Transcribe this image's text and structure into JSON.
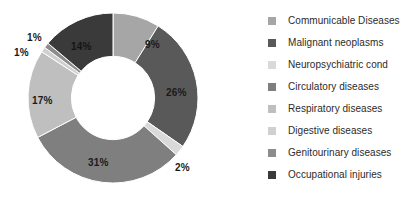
{
  "chart_data": {
    "type": "pie",
    "variant": "doughnut",
    "title": "",
    "xlabel": "",
    "ylabel": "",
    "units": "percent",
    "start_angle_deg": 0,
    "direction": "clockwise",
    "inner_radius_ratio": 0.49,
    "grid": false,
    "legend_position": "right",
    "categories": [
      "Communicable Diseases",
      "Malignant neoplasms",
      "Neuropsychiatric cond",
      "Circulatory diseases",
      "Respiratory diseases",
      "Digestive diseases",
      "Genitourinary diseases",
      "Occupational injuries"
    ],
    "values": [
      9,
      26,
      2,
      31,
      17,
      1,
      1,
      14
    ],
    "data_labels": [
      "9%",
      "26%",
      "2%",
      "31%",
      "17%",
      "1%",
      "1%",
      "14%"
    ],
    "colors": [
      "#a6a6a6",
      "#595959",
      "#d9d9d9",
      "#7f7f7f",
      "#bfbfbf",
      "#d0d0d0",
      "#8c8c8c",
      "#3a3a3a"
    ]
  },
  "legend": {
    "items": [
      {
        "label": "Communicable Diseases",
        "color": "#a6a6a6"
      },
      {
        "label": "Malignant neoplasms",
        "color": "#595959"
      },
      {
        "label": "Neuropsychiatric cond",
        "color": "#d9d9d9"
      },
      {
        "label": "Circulatory diseases",
        "color": "#7f7f7f"
      },
      {
        "label": "Respiratory diseases",
        "color": "#bfbfbf"
      },
      {
        "label": "Digestive diseases",
        "color": "#d0d0d0"
      },
      {
        "label": "Genitourinary diseases",
        "color": "#8c8c8c"
      },
      {
        "label": "Occupational injuries",
        "color": "#3a3a3a"
      }
    ]
  },
  "labels": {
    "slice_0": "9%",
    "slice_1": "26%",
    "slice_2": "2%",
    "slice_3": "31%",
    "slice_4": "17%",
    "slice_5": "1%",
    "slice_6": "1%",
    "slice_7": "14%"
  }
}
